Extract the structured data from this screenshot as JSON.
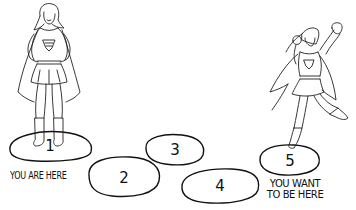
{
  "title": "",
  "figures": [
    {
      "id": "current-self",
      "pose": "standing hands on hips",
      "stone": 1
    },
    {
      "id": "goal-self",
      "pose": "flying fist raised",
      "stone": 5
    }
  ],
  "stones": [
    {
      "label": "1",
      "cx": 50,
      "cy": 146,
      "rx": 42,
      "ry": 15
    },
    {
      "label": "2",
      "cx": 124,
      "cy": 177,
      "rx": 36,
      "ry": 20
    },
    {
      "label": "3",
      "cx": 175,
      "cy": 150,
      "rx": 30,
      "ry": 16
    },
    {
      "label": "4",
      "cx": 220,
      "cy": 186,
      "rx": 39,
      "ry": 17
    },
    {
      "label": "5",
      "cx": 290,
      "cy": 160,
      "rx": 31,
      "ry": 16
    }
  ],
  "captions": {
    "start": "YOU ARE HERE",
    "goal_line1": "YOU WANT",
    "goal_line2": "TO BE HERE"
  },
  "colors": {
    "ink": "#111111",
    "background": "#ffffff"
  }
}
